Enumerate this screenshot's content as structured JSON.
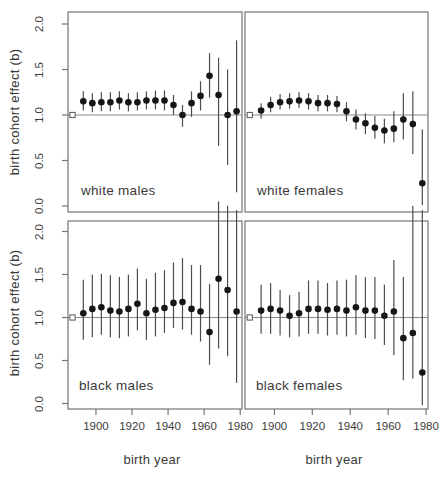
{
  "figure": {
    "ylabel": "birth cohort effect (b)",
    "xlabel": "birth year",
    "y_tick_labels": [
      "0.0",
      "0.5",
      "1.0",
      "1.5",
      "2.0"
    ],
    "x_tick_labels": [
      "1900",
      "1920",
      "1940",
      "1960",
      "1980"
    ],
    "colors": {
      "background": "#ffffff",
      "panel_border": "#757575",
      "reference_line": "#8a8a8a",
      "error_bar": "#4d4d4d",
      "point": "#161616",
      "text": "#3a3a3a"
    }
  },
  "chart_data": {
    "type": "scatter",
    "title": "",
    "xlabel": "birth year",
    "ylabel": "birth cohort effect (b)",
    "xlim": [
      1884.5,
      1981
    ],
    "ylim": [
      0,
      2
    ],
    "y_ticks": [
      0.0,
      0.5,
      1.0,
      1.5,
      2.0
    ],
    "x_ticks": [
      1900,
      1920,
      1940,
      1960,
      1980
    ],
    "legend": "none",
    "grid": false,
    "marker": "filled-circle-with-ci-bar",
    "reference": {
      "year": 1887,
      "value": 1.0,
      "marker": "open-square"
    },
    "x": [
      1893,
      1898,
      1903,
      1908,
      1913,
      1918,
      1923,
      1928,
      1933,
      1938,
      1943,
      1948,
      1953,
      1958,
      1963,
      1968,
      1973,
      1978
    ],
    "panels": [
      {
        "label": "white males",
        "position": "top-left",
        "values": [
          1.15,
          1.13,
          1.14,
          1.14,
          1.16,
          1.14,
          1.14,
          1.16,
          1.16,
          1.16,
          1.11,
          1.0,
          1.13,
          1.21,
          1.43,
          1.22,
          1.0,
          1.04
        ],
        "ci_low": [
          1.05,
          1.03,
          1.04,
          1.04,
          1.06,
          1.04,
          1.05,
          1.06,
          1.06,
          1.05,
          1.0,
          0.87,
          0.98,
          1.05,
          1.19,
          0.66,
          0.45,
          0.15
        ],
        "ci_high": [
          1.26,
          1.24,
          1.25,
          1.25,
          1.26,
          1.24,
          1.25,
          1.26,
          1.27,
          1.27,
          1.22,
          1.11,
          1.26,
          1.37,
          1.68,
          1.63,
          1.5,
          1.82
        ]
      },
      {
        "label": "white females",
        "position": "top-right",
        "values": [
          1.05,
          1.11,
          1.14,
          1.15,
          1.16,
          1.15,
          1.13,
          1.13,
          1.12,
          1.04,
          0.95,
          0.91,
          0.86,
          0.83,
          0.85,
          0.95,
          0.9,
          0.25
        ],
        "ci_low": [
          0.96,
          1.03,
          1.06,
          1.07,
          1.08,
          1.06,
          1.04,
          1.04,
          1.03,
          0.93,
          0.84,
          0.79,
          0.74,
          0.69,
          0.7,
          0.73,
          0.57,
          0.01
        ],
        "ci_high": [
          1.13,
          1.2,
          1.23,
          1.24,
          1.25,
          1.24,
          1.22,
          1.22,
          1.21,
          1.14,
          1.06,
          1.02,
          0.99,
          0.96,
          1.04,
          1.24,
          1.26,
          0.84
        ]
      },
      {
        "label": "black males",
        "position": "bottom-left",
        "values": [
          1.05,
          1.1,
          1.12,
          1.08,
          1.07,
          1.1,
          1.16,
          1.05,
          1.09,
          1.11,
          1.17,
          1.18,
          1.1,
          1.07,
          0.83,
          1.45,
          1.32,
          1.07
        ],
        "ci_low": [
          0.74,
          0.77,
          0.8,
          0.77,
          0.76,
          0.78,
          0.85,
          0.74,
          0.78,
          0.82,
          0.88,
          0.86,
          0.8,
          0.72,
          0.45,
          0.64,
          0.55,
          0.24
        ],
        "ci_high": [
          1.44,
          1.5,
          1.51,
          1.49,
          1.47,
          1.5,
          1.57,
          1.45,
          1.52,
          1.55,
          1.64,
          1.69,
          1.61,
          1.61,
          1.39,
          2.35,
          2.3,
          2.25
        ]
      },
      {
        "label": "black females",
        "position": "bottom-right",
        "values": [
          1.08,
          1.1,
          1.08,
          1.02,
          1.05,
          1.1,
          1.1,
          1.09,
          1.1,
          1.08,
          1.12,
          1.08,
          1.08,
          1.02,
          1.07,
          0.76,
          0.82,
          0.36
        ],
        "ci_low": [
          0.81,
          0.81,
          0.79,
          0.77,
          0.78,
          0.81,
          0.81,
          0.79,
          0.8,
          0.78,
          0.8,
          0.76,
          0.75,
          0.68,
          0.56,
          0.27,
          0.29,
          -0.02
        ],
        "ci_high": [
          1.38,
          1.4,
          1.32,
          1.26,
          1.3,
          1.43,
          1.43,
          1.4,
          1.43,
          1.44,
          1.49,
          1.47,
          1.47,
          1.38,
          1.67,
          1.47,
          2.3,
          2.25
        ]
      }
    ]
  }
}
